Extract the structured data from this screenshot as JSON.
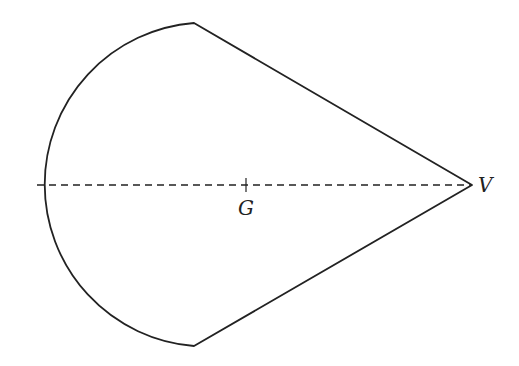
{
  "diagram": {
    "labels": {
      "centroid": "G",
      "vertex": "V"
    },
    "geometry": {
      "top_corner": [
        194,
        23
      ],
      "bottom_corner": [
        194,
        346
      ],
      "vertex_point": [
        472,
        185
      ],
      "arc_center": [
        197,
        185
      ],
      "arc_radius": 162,
      "axis_start": [
        37,
        185
      ],
      "centroid_point": [
        246,
        185
      ]
    },
    "colors": {
      "stroke": "#222222",
      "background": "#ffffff"
    }
  }
}
